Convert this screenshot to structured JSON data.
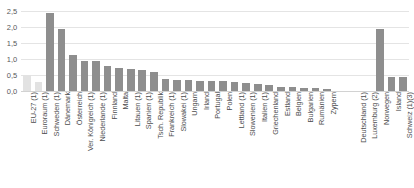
{
  "chart_data": {
    "type": "bar",
    "title": "",
    "subtitle": "",
    "xlabel": "",
    "ylabel": "",
    "ylim": [
      0.0,
      2.5
    ],
    "yticks": [
      "0,0",
      "0,5",
      "1,0",
      "1,5",
      "2,0",
      "2,5"
    ],
    "ytick_values": [
      0.0,
      0.5,
      1.0,
      1.5,
      2.0,
      2.5
    ],
    "grid": true,
    "legend": "none",
    "decimal_separator": ",",
    "colors": {
      "bar": "#8e8e8e",
      "aggregate_bar": "#e2e2e2",
      "gridline": "#e4e4e4",
      "baseline": "#d2d2d2",
      "tick_text": "#58595b",
      "label_text": "#4c4c4e",
      "background": "#ffffff"
    },
    "group_gap_after_index": 26,
    "categories": [
      "EU-27 (1)",
      "Euroraum (1)",
      "Schweden (1)",
      "Dänemark",
      "Österreich",
      "Ver. Königreich (1)",
      "Niederlande (1)",
      "Finnland",
      "Malta",
      "Litauen (1)",
      "Spanien (1)",
      "Tsch. Republik",
      "Frankreich (1)",
      "Slowakei (1)",
      "Ungarn",
      "Irland",
      "Portugal",
      "Polen",
      "Lettland (1)",
      "Slowenien (1)",
      "Italien (1)",
      "Griechenland",
      "Estland",
      "Belgien",
      "Bulgarien",
      "Rumänien",
      "Zypern",
      "Deutschland (1)",
      "Luxemburg (2)",
      "Norwegen",
      "Island",
      "Schweiz (1)(3)"
    ],
    "values": [
      0.5,
      0.27,
      2.45,
      1.95,
      1.13,
      0.95,
      0.93,
      0.79,
      0.73,
      0.68,
      0.67,
      0.59,
      0.38,
      0.34,
      0.33,
      0.32,
      0.31,
      0.3,
      0.28,
      0.25,
      0.21,
      0.2,
      0.13,
      0.12,
      0.1,
      0.09,
      0.07,
      0.0,
      0.0,
      1.95,
      0.45,
      0.43
    ],
    "aggregate_indices": [
      0,
      1
    ]
  }
}
